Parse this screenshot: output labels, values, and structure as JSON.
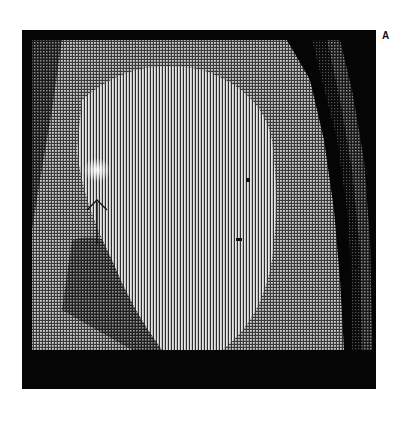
{
  "figure": {
    "panel_label": "A",
    "image_type": "MRI scan (halftone / moiré striped rendering)",
    "annotations": [
      {
        "type": "arrow",
        "direction": "up",
        "points_to": "bright focal lesion"
      }
    ],
    "colors": {
      "background": "#ffffff",
      "frame": "#050505",
      "stripe_light": "#e8e8e8",
      "stripe_dark": "#3a3a3a"
    }
  }
}
